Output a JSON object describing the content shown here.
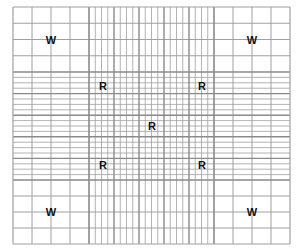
{
  "diagram": {
    "line_color": "#a0a0a0",
    "thick_line_color": "#8a8a8a",
    "label_color": "#111111",
    "corner_regions": {
      "label": "W",
      "positions": [
        "top-left",
        "top-right",
        "bottom-left",
        "bottom-right"
      ],
      "subdivisions": 4
    },
    "center_region": {
      "subdivisions": 5,
      "fine_subdivisions_per_square": 4,
      "labels": [
        {
          "text": "R",
          "position": "top-left"
        },
        {
          "text": "R",
          "position": "top-right"
        },
        {
          "text": "R",
          "position": "center"
        },
        {
          "text": "R",
          "position": "bottom-left"
        },
        {
          "text": "R",
          "position": "bottom-right"
        }
      ]
    },
    "corner_labels": [
      {
        "text": "W",
        "position": "top-left"
      },
      {
        "text": "W",
        "position": "top-right"
      },
      {
        "text": "W",
        "position": "bottom-left"
      },
      {
        "text": "W",
        "position": "bottom-right"
      }
    ]
  }
}
